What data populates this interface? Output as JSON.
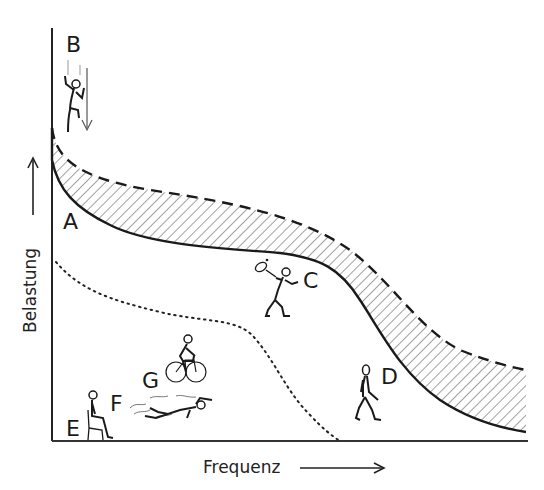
{
  "diagram": {
    "axes": {
      "x_label": "Frequenz",
      "y_label": "Belastung"
    },
    "labels": {
      "A": "A",
      "B": "B",
      "C": "C",
      "D": "D",
      "E": "E",
      "F": "F",
      "G": "G"
    },
    "figures": [
      {
        "label": "B",
        "activity": "falling-jumping figure"
      },
      {
        "label": "C",
        "activity": "tennis player"
      },
      {
        "label": "D",
        "activity": "walking figure"
      },
      {
        "label": "E",
        "activity": "seated figure"
      },
      {
        "label": "F",
        "activity": "swimmer"
      },
      {
        "label": "G",
        "activity": "cyclist"
      }
    ],
    "curves": [
      {
        "name": "solid-lower-bound",
        "style": "solid"
      },
      {
        "name": "dashed-upper-bound",
        "style": "dashed"
      },
      {
        "name": "dotted-curve",
        "style": "dotted"
      }
    ],
    "band": {
      "fill": "diagonal hatching between solid and dashed curves"
    },
    "colors": {
      "ink": "#1a1a1a",
      "background": "#ffffff"
    }
  }
}
